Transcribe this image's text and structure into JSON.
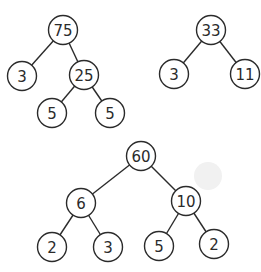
{
  "diagram": {
    "type": "binary-trees",
    "node_radius": 14.5,
    "colors": {
      "stroke": "#2b2b2b",
      "fill": "#ffffff",
      "text": "#2b2b2b",
      "background": "#ffffff"
    },
    "trees": [
      {
        "id": "tree-75",
        "nodes": [
          {
            "id": "n75",
            "label": "75",
            "x": 63,
            "y": 30
          },
          {
            "id": "n3a",
            "label": "3",
            "x": 22,
            "y": 76
          },
          {
            "id": "n25",
            "label": "25",
            "x": 84,
            "y": 75
          },
          {
            "id": "n5a",
            "label": "5",
            "x": 52,
            "y": 113
          },
          {
            "id": "n5b",
            "label": "5",
            "x": 110,
            "y": 113
          }
        ],
        "edges": [
          [
            "n75",
            "n3a"
          ],
          [
            "n75",
            "n25"
          ],
          [
            "n25",
            "n5a"
          ],
          [
            "n25",
            "n5b"
          ]
        ]
      },
      {
        "id": "tree-33",
        "nodes": [
          {
            "id": "n33",
            "label": "33",
            "x": 211,
            "y": 30
          },
          {
            "id": "n3b",
            "label": "3",
            "x": 174,
            "y": 74
          },
          {
            "id": "n11",
            "label": "11",
            "x": 245,
            "y": 74
          }
        ],
        "edges": [
          [
            "n33",
            "n3b"
          ],
          [
            "n33",
            "n11"
          ]
        ]
      },
      {
        "id": "tree-60",
        "nodes": [
          {
            "id": "n60",
            "label": "60",
            "x": 141,
            "y": 156
          },
          {
            "id": "n6",
            "label": "6",
            "x": 81,
            "y": 203
          },
          {
            "id": "n10",
            "label": "10",
            "x": 186,
            "y": 201
          },
          {
            "id": "n2a",
            "label": "2",
            "x": 52,
            "y": 247
          },
          {
            "id": "n3c",
            "label": "3",
            "x": 108,
            "y": 247
          },
          {
            "id": "n5c",
            "label": "5",
            "x": 159,
            "y": 246
          },
          {
            "id": "n2b",
            "label": "2",
            "x": 214,
            "y": 244
          }
        ],
        "edges": [
          [
            "n60",
            "n6"
          ],
          [
            "n60",
            "n10"
          ],
          [
            "n6",
            "n2a"
          ],
          [
            "n6",
            "n3c"
          ],
          [
            "n10",
            "n5c"
          ],
          [
            "n10",
            "n2b"
          ]
        ]
      }
    ]
  }
}
